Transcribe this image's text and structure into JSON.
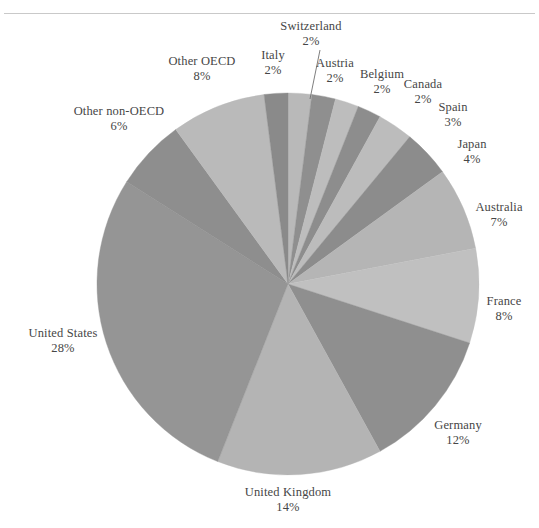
{
  "page": {
    "ghost_header_text": "",
    "background": "#ffffff",
    "rule_color": "#c9c9c9"
  },
  "chart_data": {
    "type": "pie",
    "title": "",
    "subtitle": "",
    "xlabel": "",
    "ylabel": "",
    "legend_position": "labels-around-pie",
    "grid": false,
    "units": "percent",
    "total": 100,
    "start_angle_deg": -90,
    "direction": "clockwise",
    "colors": {
      "light": "#bcbcbc",
      "dark": "#949494",
      "mid_light": "#b3b3b3",
      "mid_dark": "#8d8d8d",
      "outline": "#9a9a9a",
      "leader_line": "#6f6f6f",
      "label_text": "#464646"
    },
    "categories": [
      "Switzerland",
      "Austria",
      "Belgium",
      "Canada",
      "Spain",
      "Japan",
      "Australia",
      "France",
      "Germany",
      "United Kingdom",
      "United States",
      "Other non-OECD",
      "Other OECD",
      "Italy"
    ],
    "values": [
      2,
      2,
      2,
      2,
      3,
      4,
      7,
      8,
      12,
      14,
      28,
      6,
      8,
      2
    ],
    "slices": [
      {
        "name": "Switzerland",
        "value": 2,
        "label": "Switzerland",
        "pct": "2%",
        "color": "#b9b9b9",
        "leader": true
      },
      {
        "name": "Austria",
        "value": 2,
        "label": "Austria",
        "pct": "2%",
        "color": "#8f8f8f",
        "leader": false
      },
      {
        "name": "Belgium",
        "value": 2,
        "label": "Belgium",
        "pct": "2%",
        "color": "#bdbdbd",
        "leader": false
      },
      {
        "name": "Canada",
        "value": 2,
        "label": "Canada",
        "pct": "2%",
        "color": "#8d8d8d",
        "leader": false
      },
      {
        "name": "Spain",
        "value": 3,
        "label": "Spain",
        "pct": "3%",
        "color": "#bcbcbc",
        "leader": false
      },
      {
        "name": "Japan",
        "value": 4,
        "label": "Japan",
        "pct": "4%",
        "color": "#8c8c8c",
        "leader": false
      },
      {
        "name": "Australia",
        "value": 7,
        "label": "Australia",
        "pct": "7%",
        "color": "#b5b5b5",
        "leader": false
      },
      {
        "name": "France",
        "value": 8,
        "label": "France",
        "pct": "8%",
        "color": "#c0c0c0",
        "leader": false
      },
      {
        "name": "Germany",
        "value": 12,
        "label": "Germany",
        "pct": "12%",
        "color": "#8f8f8f",
        "leader": false
      },
      {
        "name": "United Kingdom",
        "value": 14,
        "label": "United Kingdom",
        "pct": "14%",
        "color": "#b4b4b4",
        "leader": false
      },
      {
        "name": "United States",
        "value": 28,
        "label": "United States",
        "pct": "28%",
        "color": "#959595",
        "leader": false
      },
      {
        "name": "Other non-OECD",
        "value": 6,
        "label": "Other non-OECD",
        "pct": "6%",
        "color": "#8e8e8e",
        "leader": false
      },
      {
        "name": "Other OECD",
        "value": 8,
        "label": "Other OECD",
        "pct": "8%",
        "color": "#bababa",
        "leader": false
      },
      {
        "name": "Italy",
        "value": 2,
        "label": "Italy",
        "pct": "2%",
        "color": "#8a8a8a",
        "leader": false
      }
    ],
    "geometry": {
      "center_x": 288,
      "center_y": 284,
      "radius": 191
    }
  },
  "labels": {
    "switzerland": {
      "name": "Switzerland",
      "pct": "2%"
    },
    "italy": {
      "name": "Italy",
      "pct": "2%"
    },
    "austria": {
      "name": "Austria",
      "pct": "2%"
    },
    "belgium": {
      "name": "Belgium",
      "pct": "2%"
    },
    "canada": {
      "name": "Canada",
      "pct": "2%"
    },
    "spain": {
      "name": "Spain",
      "pct": "3%"
    },
    "japan": {
      "name": "Japan",
      "pct": "4%"
    },
    "australia": {
      "name": "Australia",
      "pct": "7%"
    },
    "france": {
      "name": "France",
      "pct": "8%"
    },
    "germany": {
      "name": "Germany",
      "pct": "12%"
    },
    "united_kingdom": {
      "name": "United Kingdom",
      "pct": "14%"
    },
    "united_states": {
      "name": "United States",
      "pct": "28%"
    },
    "other_non_oecd": {
      "name": "Other non-OECD",
      "pct": "6%"
    },
    "other_oecd": {
      "name": "Other OECD",
      "pct": "8%"
    }
  }
}
